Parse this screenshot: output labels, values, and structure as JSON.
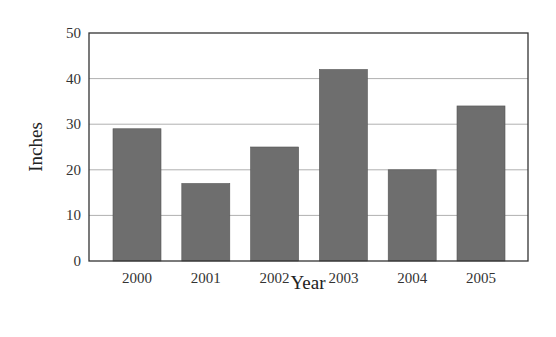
{
  "chart_data": {
    "type": "bar",
    "title": "",
    "xlabel": "Year",
    "ylabel": "Inches",
    "categories": [
      "2000",
      "2001",
      "2002",
      "2003",
      "2004",
      "2005"
    ],
    "values": [
      29,
      17,
      25,
      42,
      20,
      34
    ],
    "ylim": [
      0,
      50
    ],
    "yticks": [
      0,
      10,
      20,
      30,
      40,
      50
    ],
    "grid": true,
    "legend": null,
    "colors": {
      "bar": "#6e6e6e",
      "bar_edge": "#555555",
      "grid": "#b0b0b0",
      "frame": "#333333"
    }
  }
}
